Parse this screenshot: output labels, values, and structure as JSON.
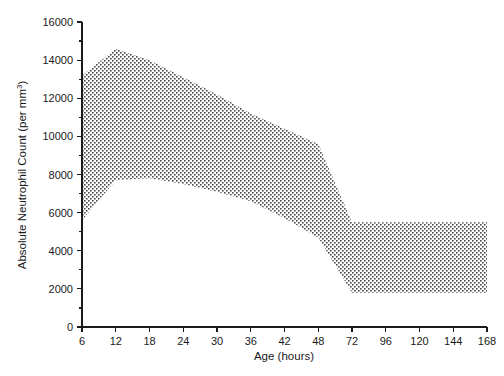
{
  "chart_data": {
    "type": "area",
    "title": "",
    "xlabel": "Age (hours)",
    "ylabel": "Absolute Neutrophil Count (per mm",
    "ylabel_super": "3",
    "ylabel_tail": ")",
    "ylabel_full": "Absolute Neutrophil Count (per mm3)",
    "x": [
      6,
      12,
      18,
      24,
      30,
      36,
      42,
      48,
      72,
      96,
      120,
      144,
      168
    ],
    "xtick_labels": [
      "6",
      "12",
      "18",
      "24",
      "30",
      "36",
      "42",
      "48",
      "72",
      "96",
      "120",
      "144",
      "168"
    ],
    "ytick_labels": [
      "0",
      "2000",
      "4000",
      "6000",
      "8000",
      "10000",
      "12000",
      "14000",
      "16000"
    ],
    "yticks": [
      0,
      2000,
      4000,
      6000,
      8000,
      10000,
      12000,
      14000,
      16000
    ],
    "ylim": [
      0,
      16000
    ],
    "xlim_index": [
      0,
      12
    ],
    "grid": false,
    "legend": false,
    "axis_spacing": "categorical-even",
    "series": [
      {
        "name": "Upper reference limit",
        "values": [
          13200,
          14600,
          14000,
          13100,
          12200,
          11200,
          10400,
          9600,
          5500,
          5500,
          5500,
          5500,
          5500
        ]
      },
      {
        "name": "Lower reference limit",
        "values": [
          5600,
          7700,
          7800,
          7500,
          7100,
          6600,
          5700,
          4700,
          1800,
          1800,
          1800,
          1800,
          1800
        ]
      }
    ],
    "fill_between": {
      "upper": "Upper reference limit",
      "lower": "Lower reference limit",
      "pattern": "dotted-checkerboard",
      "pattern_color": "#555555",
      "background": "#ffffff"
    },
    "colors": {
      "axis": "#1a1a1a",
      "text": "#1a1a1a",
      "band_dots": "#555555",
      "background": "#ffffff"
    }
  }
}
